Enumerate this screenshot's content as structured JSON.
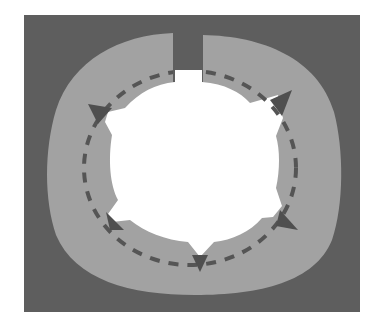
{
  "diagram": {
    "colors": {
      "page_background": "#ffffff",
      "frame_fill": "#5e5e5e",
      "ring_fill": "#a2a2a2",
      "center_fill": "#ffffff",
      "dash_stroke": "#555555",
      "marker_fill": "#4f4f4f"
    },
    "frame": {
      "x": 24,
      "y": 15,
      "width": 336,
      "height": 297
    },
    "ring": {
      "outer_left": 46,
      "outer_right": 342,
      "outer_top": 33,
      "outer_bottom": 295,
      "gap_x_start": 173,
      "gap_x_end": 203
    },
    "center": {
      "cx": 190,
      "cy": 170,
      "r": 88
    },
    "dashed_path": {
      "cx": 190,
      "cy": 168,
      "rx": 106,
      "ry": 97,
      "dash": "10 9"
    },
    "markers": [
      {
        "id": "marker-upper-left",
        "x": 98,
        "y": 108
      },
      {
        "id": "marker-upper-right",
        "x": 284,
        "y": 100
      },
      {
        "id": "marker-lower-left",
        "x": 113,
        "y": 224
      },
      {
        "id": "marker-lower-right",
        "x": 286,
        "y": 222
      },
      {
        "id": "marker-bottom",
        "x": 200,
        "y": 263
      }
    ]
  }
}
